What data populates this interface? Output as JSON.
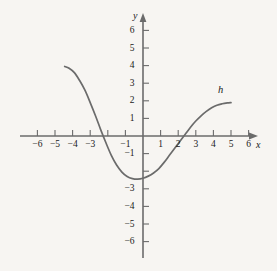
{
  "figure": {
    "background_color": "#f7f5f2",
    "ink_color": "#6b6b6b",
    "text_color": "#1a1a1a",
    "curve_label": "h",
    "x_axis_name": "x",
    "y_axis_name": "y"
  },
  "chart_data": {
    "type": "line",
    "title": "",
    "xlabel": "x",
    "ylabel": "y",
    "curve_label": "h",
    "xlim": [
      -6.9,
      6.5
    ],
    "ylim": [
      -6.9,
      6.9
    ],
    "grid": false,
    "legend_position": "inline-right",
    "x_ticks": [
      -6,
      -5,
      -4,
      -3,
      -2,
      -1,
      1,
      2,
      3,
      4,
      5,
      6
    ],
    "x_tick_labels": [
      "−6",
      "−5",
      "−4",
      "−3",
      "−2",
      "−1",
      "1",
      "2",
      "3",
      "4",
      "5",
      "6"
    ],
    "y_ticks": [
      6,
      5,
      4,
      3,
      2,
      1,
      -1,
      -2,
      -3,
      -4,
      -5,
      -6
    ],
    "y_tick_labels": [
      "6",
      "5",
      "4",
      "3",
      "2",
      "1",
      "−1",
      "",
      "−3",
      "−4",
      "−5",
      "−6"
    ],
    "zero_label_shown": false,
    "x": [
      -4.45,
      -4.2,
      -3.9,
      -3.6,
      -3.3,
      -3.0,
      -2.7,
      -2.4,
      -2.1,
      -1.8,
      -1.5,
      -1.2,
      -0.9,
      -0.6,
      -0.3,
      0.0,
      0.3,
      0.6,
      0.9,
      1.2,
      1.5,
      1.8,
      2.1,
      2.4,
      2.7,
      3.0,
      3.3,
      3.6,
      3.9,
      4.2,
      4.5,
      4.8,
      5.0
    ],
    "y": [
      3.95,
      3.85,
      3.6,
      3.15,
      2.6,
      1.9,
      1.15,
      0.35,
      -0.4,
      -1.1,
      -1.65,
      -2.05,
      -2.3,
      -2.42,
      -2.45,
      -2.4,
      -2.28,
      -2.1,
      -1.85,
      -1.5,
      -1.1,
      -0.7,
      -0.3,
      0.1,
      0.5,
      0.85,
      1.15,
      1.4,
      1.6,
      1.75,
      1.83,
      1.88,
      1.9
    ],
    "annotations": [
      {
        "text": "h",
        "x": 4.45,
        "y": 2.6
      }
    ],
    "x_intercepts": [
      -2.3,
      2.5
    ],
    "minimum": {
      "x": -0.3,
      "y": -2.45
    },
    "endpoints": [
      {
        "x": -4.45,
        "y": 3.95
      },
      {
        "x": 5.0,
        "y": 1.9
      }
    ]
  }
}
